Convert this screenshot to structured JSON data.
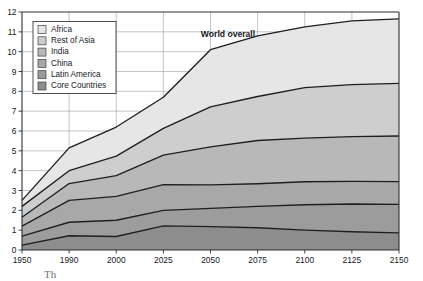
{
  "chart_data": {
    "type": "area",
    "title": "",
    "subtitle": "",
    "xlabel": "",
    "ylabel": "",
    "annotation": "World overall",
    "x": [
      "1950",
      "1990",
      "2000",
      "2025",
      "2050",
      "2075",
      "2100",
      "2125",
      "2150"
    ],
    "xtick_labels": [
      "1950",
      "1990",
      "2000",
      "2025",
      "2050",
      "2075",
      "2100",
      "2125",
      "2150"
    ],
    "ytick_labels": [
      "0",
      "1",
      "2",
      "3",
      "4",
      "5",
      "6",
      "7",
      "8",
      "9",
      "10",
      "11",
      "12"
    ],
    "ylim": [
      0,
      12
    ],
    "ystep": 1,
    "grid": true,
    "legend_position": "top-left",
    "stacked": true,
    "stack_order_bottom_to_top": [
      "Core Countries",
      "Latin America",
      "China",
      "India",
      "Rest of Asia",
      "Africa"
    ],
    "legend_order_top_to_bottom": [
      "Africa",
      "Rest of Asia",
      "India",
      "China",
      "Latin America",
      "Core Countries"
    ],
    "series": [
      {
        "name": "Core Countries",
        "color": "#8d8d8d",
        "values": [
          0.25,
          0.72,
          0.68,
          1.22,
          1.18,
          1.12,
          1.0,
          0.92,
          0.86
        ]
      },
      {
        "name": "Latin America",
        "color": "#9c9c9c",
        "values": [
          0.45,
          0.68,
          0.82,
          0.78,
          0.92,
          1.08,
          1.28,
          1.4,
          1.44
        ]
      },
      {
        "name": "China",
        "color": "#a8a8a8",
        "values": [
          0.5,
          1.1,
          1.2,
          1.3,
          1.18,
          1.14,
          1.16,
          1.14,
          1.15
        ]
      },
      {
        "name": "India",
        "color": "#b8b8b8",
        "values": [
          0.45,
          0.85,
          1.05,
          1.48,
          1.92,
          2.18,
          2.2,
          2.26,
          2.3
        ]
      },
      {
        "name": "Rest of Asia",
        "color": "#cecece",
        "values": [
          0.55,
          0.65,
          0.98,
          1.35,
          2.02,
          2.22,
          2.55,
          2.62,
          2.65
        ]
      },
      {
        "name": "Africa",
        "color": "#e6e6e6",
        "values": [
          0.3,
          1.15,
          2.47,
          3.47,
          4.28,
          4.66,
          4.88,
          5.06,
          5.25
        ]
      }
    ],
    "cumulative_tops": {
      "Core Countries": [
        0.25,
        0.72,
        0.68,
        1.22,
        1.18,
        1.12,
        1.0,
        0.92,
        0.86
      ],
      "Latin America": [
        0.7,
        1.4,
        1.5,
        2.0,
        2.1,
        2.2,
        2.28,
        2.32,
        2.3
      ],
      "China": [
        1.2,
        2.5,
        2.7,
        3.3,
        3.28,
        3.34,
        3.44,
        3.46,
        3.45
      ],
      "India": [
        1.65,
        3.35,
        3.75,
        4.78,
        5.2,
        5.52,
        5.64,
        5.72,
        5.75
      ],
      "Rest of Asia": [
        2.2,
        4.0,
        4.73,
        6.13,
        7.22,
        7.74,
        8.19,
        8.34,
        8.4
      ],
      "Africa": [
        2.5,
        5.15,
        7.2,
        9.6,
        11.5,
        12.4,
        13.07,
        13.4,
        13.65
      ]
    },
    "world_total": [
      2.5,
      5.15,
      6.2,
      7.7,
      10.1,
      10.8,
      11.25,
      11.55,
      11.65
    ]
  },
  "legend": {
    "items": [
      {
        "label": "Africa",
        "color": "#e6e6e6"
      },
      {
        "label": "Rest of Asia",
        "color": "#cecece"
      },
      {
        "label": "India",
        "color": "#b8b8b8"
      },
      {
        "label": "China",
        "color": "#a8a8a8"
      },
      {
        "label": "Latin America",
        "color": "#9c9c9c"
      },
      {
        "label": "Core Countries",
        "color": "#8d8d8d"
      }
    ]
  },
  "annotations": {
    "world_overall": "World overall"
  },
  "caption": {
    "text": "Th"
  }
}
